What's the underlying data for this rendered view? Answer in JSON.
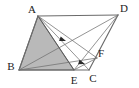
{
  "figure": {
    "shape_type": "geometry-diagram",
    "colors": {
      "background": "#ffffff",
      "stroke": "#5a5a5a",
      "shade_fill": "#b9b9b9",
      "label": "#1c1c1c",
      "arrow": "#2b2b2b"
    },
    "vertices": [
      {
        "id": "A",
        "label": "A",
        "x": 38,
        "y": 16,
        "label_x": 32,
        "label_y": 13
      },
      {
        "id": "D",
        "label": "D",
        "x": 118,
        "y": 15,
        "label_x": 124,
        "label_y": 12
      },
      {
        "id": "B",
        "label": "B",
        "x": 19,
        "y": 70,
        "label_x": 11,
        "label_y": 70
      },
      {
        "id": "E",
        "label": "E",
        "x": 74,
        "y": 70,
        "label_x": 74,
        "label_y": 84
      },
      {
        "id": "C",
        "label": "C",
        "x": 89,
        "y": 70,
        "label_x": 93,
        "label_y": 82
      },
      {
        "id": "F",
        "label": "F",
        "x": 97,
        "y": 58,
        "label_x": 101,
        "label_y": 57
      }
    ],
    "segments": [
      {
        "name": "segment-AD",
        "from": "A",
        "to": "D",
        "style": "edge-outer"
      },
      {
        "name": "segment-AB",
        "from": "A",
        "to": "B",
        "style": "edge-outer"
      },
      {
        "name": "segment-BC",
        "from": "B",
        "to": "C",
        "style": "edge-outer"
      },
      {
        "name": "segment-DC",
        "from": "D",
        "to": "C",
        "style": "edge-outer"
      },
      {
        "name": "segment-AE",
        "from": "A",
        "to": "E",
        "style": "edge"
      },
      {
        "name": "segment-AC",
        "from": "A",
        "to": "C",
        "style": "edge-thin"
      },
      {
        "name": "segment-AF",
        "from": "A",
        "to": "F",
        "style": "edge-thin"
      },
      {
        "name": "segment-BD",
        "from": "B",
        "to": "D",
        "style": "edge-thin"
      },
      {
        "name": "segment-BF",
        "from": "B",
        "to": "F",
        "style": "edge-thin"
      },
      {
        "name": "segment-DE",
        "from": "D",
        "to": "E",
        "style": "edge-thin"
      },
      {
        "name": "segment-EF",
        "from": "E",
        "to": "F",
        "style": "edge-thin"
      }
    ],
    "shaded_region": {
      "name": "shaded-triangle-ABE",
      "points": "A B E",
      "fill": "#b9b9b9"
    },
    "arrow_marks": [
      {
        "name": "arrow-mark-1",
        "x": 66,
        "y": 41,
        "angle": 200
      },
      {
        "name": "arrow-mark-2",
        "x": 85,
        "y": 64,
        "angle": 198
      }
    ]
  }
}
